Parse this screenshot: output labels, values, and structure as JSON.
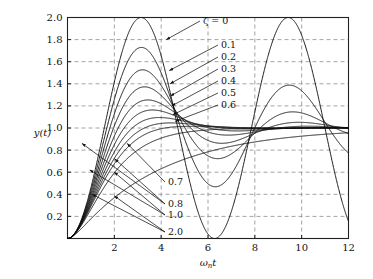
{
  "chart_data": {
    "type": "line",
    "title": "",
    "subtitle": "",
    "xlabel": "ωₙt",
    "ylabel": "y(t)",
    "xlim": [
      0,
      12
    ],
    "ylim": [
      0,
      2.0
    ],
    "grid": true,
    "grid_style": "dashed",
    "legend_position": "inline-annotations",
    "x_ticks": [
      "2",
      "4",
      "6",
      "8",
      "10",
      "12"
    ],
    "x_tick_values": [
      2,
      4,
      6,
      8,
      10,
      12
    ],
    "y_ticks": [
      "0.2",
      "0.4",
      "0.6",
      "0.8",
      "1.0",
      "1.2",
      "1.4",
      "1.6",
      "1.8",
      "2.0"
    ],
    "y_tick_values": [
      0.2,
      0.4,
      0.6,
      0.8,
      1.0,
      1.2,
      1.4,
      1.6,
      1.8,
      2.0
    ],
    "formula": "y(t) = 1 - e^{-ζωₙt}[cos(ω_d t) + (ζ/√(1-ζ²)) sin(ω_d t)]",
    "parameter_symbol": "ζ",
    "series": [
      {
        "name": "ζ = 0",
        "zeta": 0.0,
        "label": "ζ = 0",
        "peak": 2.0,
        "peak_x": 3.14
      },
      {
        "name": "0.1",
        "zeta": 0.1,
        "label": "0.1",
        "peak": 1.729,
        "peak_x": 3.16
      },
      {
        "name": "0.2",
        "zeta": 0.2,
        "label": "0.2",
        "peak": 1.527,
        "peak_x": 3.21
      },
      {
        "name": "0.3",
        "zeta": 0.3,
        "label": "0.3",
        "peak": 1.372,
        "peak_x": 3.29
      },
      {
        "name": "0.4",
        "zeta": 0.4,
        "label": "0.4",
        "peak": 1.254,
        "peak_x": 3.43
      },
      {
        "name": "0.5",
        "zeta": 0.5,
        "label": "0.5",
        "peak": 1.163,
        "peak_x": 3.63
      },
      {
        "name": "0.6",
        "zeta": 0.6,
        "label": "0.6",
        "peak": 1.095,
        "peak_x": 3.93
      },
      {
        "name": "0.7",
        "zeta": 0.7,
        "label": "0.7",
        "peak": 1.046,
        "peak_x": 4.4
      },
      {
        "name": "0.8",
        "zeta": 0.8,
        "label": "0.8",
        "peak": 1.015,
        "peak_x": 5.24
      },
      {
        "name": "1.0",
        "zeta": 1.0,
        "label": "1.0",
        "peak": 1.0,
        "peak_x": 12.0
      },
      {
        "name": "2.0",
        "zeta": 2.0,
        "label": "2.0",
        "peak": 0.95,
        "peak_x": 12.0
      }
    ],
    "annotations": [
      {
        "label": "ζ = 0",
        "target_zeta": 0.0
      },
      {
        "label": "0.1",
        "target_zeta": 0.1
      },
      {
        "label": "0.2",
        "target_zeta": 0.2
      },
      {
        "label": "0.3",
        "target_zeta": 0.3
      },
      {
        "label": "0.4",
        "target_zeta": 0.4
      },
      {
        "label": "0.5",
        "target_zeta": 0.5
      },
      {
        "label": "0.6",
        "target_zeta": 0.6
      },
      {
        "label": "0.7",
        "target_zeta": 0.7
      },
      {
        "label": "0.8",
        "target_zeta": 0.8
      },
      {
        "label": "1.0",
        "target_zeta": 1.0
      },
      {
        "label": "2.0",
        "target_zeta": 2.0
      }
    ]
  },
  "axes": {
    "y_label_text": "y(t)",
    "x_label_text": "ωₙt",
    "x_label_main": "ω",
    "x_label_sub": "n",
    "x_label_var": "t"
  },
  "style": {
    "curve_color": "#111111",
    "grid_color": "#8c8c8c",
    "frame_color": "#222222",
    "background": "#ffffff"
  }
}
